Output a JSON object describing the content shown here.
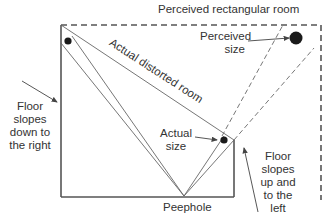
{
  "diagram": {
    "labels": {
      "perceived_room": "Perceived rectangular room",
      "actual_room": "Actual distorted room",
      "perceived_size_line1": "Perceived",
      "perceived_size_line2": "size",
      "actual_size_line1": "Actual",
      "actual_size_line2": "size",
      "peephole": "Peephole",
      "left_floor": [
        "Floor",
        "slopes",
        "down to",
        "the right"
      ],
      "right_floor": [
        "Floor",
        "slopes",
        "up and",
        "to the",
        "left"
      ]
    },
    "colors": {
      "line": "#555555",
      "dot": "#1a1a1a",
      "text": "#333333"
    }
  }
}
